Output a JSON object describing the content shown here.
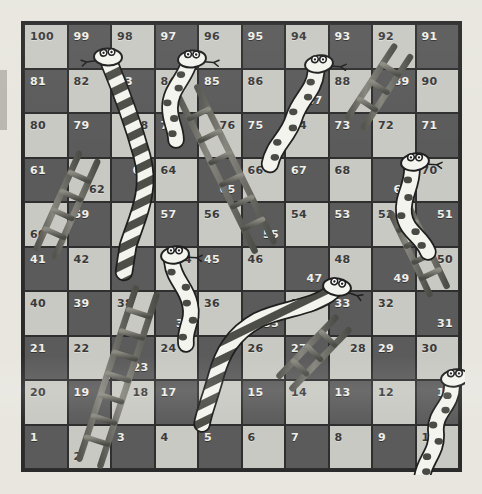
{
  "board": {
    "title": "Snakes and Ladders",
    "rows": 10,
    "columns": 10,
    "min_square": 1,
    "max_square": 100,
    "colors": {
      "light_square": "#c9c9c3",
      "dark_square": "#5b5b5b",
      "border": "#2b2b2b",
      "background": "#e8e6df",
      "snake_body": "#f2f2ec",
      "snake_marking": "#4a4a4a",
      "ladder": "#6b6b68"
    },
    "squares": [
      {
        "n": 100,
        "row": 1,
        "col": 1,
        "shade": "light",
        "pos": "tl"
      },
      {
        "n": 99,
        "row": 1,
        "col": 2,
        "shade": "dark",
        "pos": "tl"
      },
      {
        "n": 98,
        "row": 1,
        "col": 3,
        "shade": "light",
        "pos": "tl"
      },
      {
        "n": 97,
        "row": 1,
        "col": 4,
        "shade": "dark",
        "pos": "tl"
      },
      {
        "n": 96,
        "row": 1,
        "col": 5,
        "shade": "light",
        "pos": "tl"
      },
      {
        "n": 95,
        "row": 1,
        "col": 6,
        "shade": "dark",
        "pos": "tl"
      },
      {
        "n": 94,
        "row": 1,
        "col": 7,
        "shade": "light",
        "pos": "tl"
      },
      {
        "n": 93,
        "row": 1,
        "col": 8,
        "shade": "dark",
        "pos": "tl"
      },
      {
        "n": 92,
        "row": 1,
        "col": 9,
        "shade": "light",
        "pos": "tl"
      },
      {
        "n": 91,
        "row": 1,
        "col": 10,
        "shade": "dark",
        "pos": "tl"
      },
      {
        "n": 81,
        "row": 2,
        "col": 1,
        "shade": "dark",
        "pos": "tl"
      },
      {
        "n": 82,
        "row": 2,
        "col": 2,
        "shade": "light",
        "pos": "tl"
      },
      {
        "n": 83,
        "row": 2,
        "col": 3,
        "shade": "dark",
        "pos": "tl"
      },
      {
        "n": 84,
        "row": 2,
        "col": 4,
        "shade": "light",
        "pos": "tl"
      },
      {
        "n": 85,
        "row": 2,
        "col": 5,
        "shade": "dark",
        "pos": "tl"
      },
      {
        "n": 86,
        "row": 2,
        "col": 6,
        "shade": "light",
        "pos": "tl"
      },
      {
        "n": 87,
        "row": 2,
        "col": 7,
        "shade": "dark",
        "pos": "br"
      },
      {
        "n": 88,
        "row": 2,
        "col": 8,
        "shade": "light",
        "pos": "tl"
      },
      {
        "n": 89,
        "row": 2,
        "col": 9,
        "shade": "dark",
        "pos": "tr"
      },
      {
        "n": 90,
        "row": 2,
        "col": 10,
        "shade": "light",
        "pos": "tl"
      },
      {
        "n": 80,
        "row": 3,
        "col": 1,
        "shade": "light",
        "pos": "tl"
      },
      {
        "n": 79,
        "row": 3,
        "col": 2,
        "shade": "dark",
        "pos": "tl"
      },
      {
        "n": 78,
        "row": 3,
        "col": 3,
        "shade": "light",
        "pos": "tr"
      },
      {
        "n": 77,
        "row": 3,
        "col": 4,
        "shade": "dark",
        "pos": "tl"
      },
      {
        "n": 76,
        "row": 3,
        "col": 5,
        "shade": "light",
        "pos": "tr"
      },
      {
        "n": 75,
        "row": 3,
        "col": 6,
        "shade": "dark",
        "pos": "tl"
      },
      {
        "n": 74,
        "row": 3,
        "col": 7,
        "shade": "light",
        "pos": "tl"
      },
      {
        "n": 73,
        "row": 3,
        "col": 8,
        "shade": "dark",
        "pos": "tl"
      },
      {
        "n": 72,
        "row": 3,
        "col": 9,
        "shade": "light",
        "pos": "tl"
      },
      {
        "n": 71,
        "row": 3,
        "col": 10,
        "shade": "dark",
        "pos": "tl"
      },
      {
        "n": 61,
        "row": 4,
        "col": 1,
        "shade": "dark",
        "pos": "tl"
      },
      {
        "n": 62,
        "row": 4,
        "col": 2,
        "shade": "light",
        "pos": "br"
      },
      {
        "n": 63,
        "row": 4,
        "col": 3,
        "shade": "dark",
        "pos": "tr"
      },
      {
        "n": 64,
        "row": 4,
        "col": 4,
        "shade": "light",
        "pos": "tl"
      },
      {
        "n": 65,
        "row": 4,
        "col": 5,
        "shade": "dark",
        "pos": "br"
      },
      {
        "n": 66,
        "row": 4,
        "col": 6,
        "shade": "light",
        "pos": "tl"
      },
      {
        "n": 67,
        "row": 4,
        "col": 7,
        "shade": "dark",
        "pos": "tl"
      },
      {
        "n": 68,
        "row": 4,
        "col": 8,
        "shade": "light",
        "pos": "tl"
      },
      {
        "n": 69,
        "row": 4,
        "col": 9,
        "shade": "dark",
        "pos": "br"
      },
      {
        "n": 70,
        "row": 4,
        "col": 10,
        "shade": "light",
        "pos": "tl"
      },
      {
        "n": 60,
        "row": 5,
        "col": 1,
        "shade": "light",
        "pos": "bl"
      },
      {
        "n": 59,
        "row": 5,
        "col": 2,
        "shade": "dark",
        "pos": "tl"
      },
      {
        "n": 58,
        "row": 5,
        "col": 3,
        "shade": "light",
        "pos": "tr"
      },
      {
        "n": 57,
        "row": 5,
        "col": 4,
        "shade": "dark",
        "pos": "tl"
      },
      {
        "n": 56,
        "row": 5,
        "col": 5,
        "shade": "light",
        "pos": "tl"
      },
      {
        "n": 55,
        "row": 5,
        "col": 6,
        "shade": "dark",
        "pos": "br"
      },
      {
        "n": 54,
        "row": 5,
        "col": 7,
        "shade": "light",
        "pos": "tl"
      },
      {
        "n": 53,
        "row": 5,
        "col": 8,
        "shade": "dark",
        "pos": "tl"
      },
      {
        "n": 52,
        "row": 5,
        "col": 9,
        "shade": "light",
        "pos": "tl"
      },
      {
        "n": 51,
        "row": 5,
        "col": 10,
        "shade": "dark",
        "pos": "tr"
      },
      {
        "n": 41,
        "row": 6,
        "col": 1,
        "shade": "dark",
        "pos": "tl"
      },
      {
        "n": 42,
        "row": 6,
        "col": 2,
        "shade": "light",
        "pos": "tl"
      },
      {
        "n": 43,
        "row": 6,
        "col": 3,
        "shade": "dark",
        "pos": "tl"
      },
      {
        "n": 44,
        "row": 6,
        "col": 4,
        "shade": "light",
        "pos": "tr"
      },
      {
        "n": 45,
        "row": 6,
        "col": 5,
        "shade": "dark",
        "pos": "tl"
      },
      {
        "n": 46,
        "row": 6,
        "col": 6,
        "shade": "light",
        "pos": "tl"
      },
      {
        "n": 47,
        "row": 6,
        "col": 7,
        "shade": "dark",
        "pos": "br"
      },
      {
        "n": 48,
        "row": 6,
        "col": 8,
        "shade": "light",
        "pos": "tl"
      },
      {
        "n": 49,
        "row": 6,
        "col": 9,
        "shade": "dark",
        "pos": "br"
      },
      {
        "n": 50,
        "row": 6,
        "col": 10,
        "shade": "light",
        "pos": "tr"
      },
      {
        "n": 40,
        "row": 7,
        "col": 1,
        "shade": "light",
        "pos": "tl"
      },
      {
        "n": 39,
        "row": 7,
        "col": 2,
        "shade": "dark",
        "pos": "tl"
      },
      {
        "n": 38,
        "row": 7,
        "col": 3,
        "shade": "light",
        "pos": "tl"
      },
      {
        "n": 37,
        "row": 7,
        "col": 4,
        "shade": "dark",
        "pos": "br"
      },
      {
        "n": 36,
        "row": 7,
        "col": 5,
        "shade": "light",
        "pos": "tl"
      },
      {
        "n": 35,
        "row": 7,
        "col": 6,
        "shade": "dark",
        "pos": "br"
      },
      {
        "n": 34,
        "row": 7,
        "col": 7,
        "shade": "light",
        "pos": "tl"
      },
      {
        "n": 33,
        "row": 7,
        "col": 8,
        "shade": "dark",
        "pos": "tl"
      },
      {
        "n": 32,
        "row": 7,
        "col": 9,
        "shade": "light",
        "pos": "tl"
      },
      {
        "n": 31,
        "row": 7,
        "col": 10,
        "shade": "dark",
        "pos": "br"
      },
      {
        "n": 21,
        "row": 8,
        "col": 1,
        "shade": "dark",
        "pos": "tl"
      },
      {
        "n": 22,
        "row": 8,
        "col": 2,
        "shade": "light",
        "pos": "tl"
      },
      {
        "n": 23,
        "row": 8,
        "col": 3,
        "shade": "dark",
        "pos": "br"
      },
      {
        "n": 24,
        "row": 8,
        "col": 4,
        "shade": "light",
        "pos": "tl"
      },
      {
        "n": 25,
        "row": 8,
        "col": 5,
        "shade": "dark",
        "pos": "tr"
      },
      {
        "n": 26,
        "row": 8,
        "col": 6,
        "shade": "light",
        "pos": "tl"
      },
      {
        "n": 27,
        "row": 8,
        "col": 7,
        "shade": "dark",
        "pos": "tl"
      },
      {
        "n": 28,
        "row": 8,
        "col": 8,
        "shade": "light",
        "pos": "tr"
      },
      {
        "n": 29,
        "row": 8,
        "col": 9,
        "shade": "dark",
        "pos": "tl"
      },
      {
        "n": 30,
        "row": 8,
        "col": 10,
        "shade": "light",
        "pos": "tl"
      },
      {
        "n": 20,
        "row": 9,
        "col": 1,
        "shade": "light",
        "pos": "tl"
      },
      {
        "n": 19,
        "row": 9,
        "col": 2,
        "shade": "dark",
        "pos": "tl"
      },
      {
        "n": 18,
        "row": 9,
        "col": 3,
        "shade": "light",
        "pos": "tr"
      },
      {
        "n": 17,
        "row": 9,
        "col": 4,
        "shade": "dark",
        "pos": "tl"
      },
      {
        "n": 16,
        "row": 9,
        "col": 5,
        "shade": "light",
        "pos": "tl"
      },
      {
        "n": 15,
        "row": 9,
        "col": 6,
        "shade": "dark",
        "pos": "tl"
      },
      {
        "n": 14,
        "row": 9,
        "col": 7,
        "shade": "light",
        "pos": "tl"
      },
      {
        "n": 13,
        "row": 9,
        "col": 8,
        "shade": "dark",
        "pos": "tl"
      },
      {
        "n": 12,
        "row": 9,
        "col": 9,
        "shade": "light",
        "pos": "tl"
      },
      {
        "n": 11,
        "row": 9,
        "col": 10,
        "shade": "dark",
        "pos": "tr"
      },
      {
        "n": 1,
        "row": 10,
        "col": 1,
        "shade": "dark",
        "pos": "tl"
      },
      {
        "n": 2,
        "row": 10,
        "col": 2,
        "shade": "light",
        "pos": "bl"
      },
      {
        "n": 3,
        "row": 10,
        "col": 3,
        "shade": "dark",
        "pos": "tl"
      },
      {
        "n": 4,
        "row": 10,
        "col": 4,
        "shade": "light",
        "pos": "tl"
      },
      {
        "n": 5,
        "row": 10,
        "col": 5,
        "shade": "dark",
        "pos": "tl"
      },
      {
        "n": 6,
        "row": 10,
        "col": 6,
        "shade": "light",
        "pos": "tl"
      },
      {
        "n": 7,
        "row": 10,
        "col": 7,
        "shade": "dark",
        "pos": "tl"
      },
      {
        "n": 8,
        "row": 10,
        "col": 8,
        "shade": "light",
        "pos": "tl"
      },
      {
        "n": 9,
        "row": 10,
        "col": 9,
        "shade": "dark",
        "pos": "tl"
      },
      {
        "n": 10,
        "row": 10,
        "col": 10,
        "shade": "light",
        "pos": "tl"
      }
    ],
    "snakes": [
      {
        "id": "snake-99-42",
        "head": 99,
        "tail": 42,
        "pattern": "striped",
        "path": "M 85,38 C 95,62 108,96 118,132 C 128,168 112,196 104,222 L 100,248",
        "head_x": 84,
        "head_y": 33,
        "head_angle": -12,
        "tongue": "left",
        "width": 15
      },
      {
        "id": "snake-97-83",
        "head": 97,
        "tail": 83,
        "pattern": "spotted",
        "path": "M 164,42 C 158,58 146,66 146,84 C 146,98 152,104 152,116",
        "head_x": 168,
        "head_y": 35,
        "head_angle": 8,
        "tongue": "right",
        "width": 14
      },
      {
        "id": "snake-94-75",
        "head": 94,
        "tail": 75,
        "pattern": "spotted",
        "path": "M 292,48 C 290,68 276,74 270,94 C 264,114 250,120 246,140",
        "head_x": 295,
        "head_y": 40,
        "head_angle": 6,
        "tongue": "right",
        "width": 15
      },
      {
        "id": "snake-72-51",
        "head": 72,
        "tail": 51,
        "pattern": "spotted",
        "path": "M 388,145 C 388,164 378,172 380,190 C 382,208 398,212 404,228",
        "head_x": 391,
        "head_y": 138,
        "head_angle": 6,
        "tongue": "right",
        "width": 14
      },
      {
        "id": "snake-58-37",
        "head": 58,
        "tail": 37,
        "pattern": "spotted",
        "path": "M 148,238 C 150,256 162,262 166,280 C 170,298 160,304 162,320",
        "head_x": 151,
        "head_y": 231,
        "head_angle": 6,
        "tongue": "right",
        "width": 14
      },
      {
        "id": "snake-47-17",
        "head": 47,
        "tail": 17,
        "pattern": "striped",
        "path": "M 308,268 C 290,284 258,284 234,296 C 208,310 198,330 192,352 C 186,374 180,388 178,400",
        "head_x": 313,
        "head_y": 263,
        "head_angle": 22,
        "tongue": "right",
        "width": 14
      },
      {
        "id": "snake-30-9",
        "head": 30,
        "tail": 9,
        "pattern": "spotted",
        "path": "M 428,362 C 428,382 410,388 412,408 C 414,428 400,436 398,454",
        "head_x": 431,
        "head_y": 354,
        "head_angle": 6,
        "tongue": "right",
        "width": 14
      }
    ],
    "ladders": [
      {
        "id": "ladder-2-38",
        "bottom": 2,
        "top": 38,
        "x1": 66,
        "y1": 438,
        "x2": 122,
        "y2": 268,
        "rungs": 7,
        "width": 22
      },
      {
        "id": "ladder-60-80",
        "bottom": 60,
        "top": 80,
        "x1": 22,
        "y1": 228,
        "x2": 64,
        "y2": 134,
        "rungs": 4,
        "width": 20
      },
      {
        "id": "ladder-55-85",
        "bottom": 55,
        "top": 85,
        "x1": 240,
        "y1": 222,
        "x2": 164,
        "y2": 68,
        "rungs": 6,
        "width": 21
      },
      {
        "id": "ladder-88-92",
        "bottom": 88,
        "top": 92,
        "x1": 332,
        "y1": 98,
        "x2": 378,
        "y2": 28,
        "rungs": 3,
        "width": 19
      },
      {
        "id": "ladder-31-50",
        "bottom": 31,
        "top": 50,
        "x1": 414,
        "y1": 266,
        "x2": 376,
        "y2": 186,
        "rungs": 4,
        "width": 19
      },
      {
        "id": "ladder-27-34",
        "bottom": 27,
        "top": 34,
        "x1": 262,
        "y1": 358,
        "x2": 318,
        "y2": 300,
        "rungs": 3,
        "width": 18
      }
    ]
  }
}
